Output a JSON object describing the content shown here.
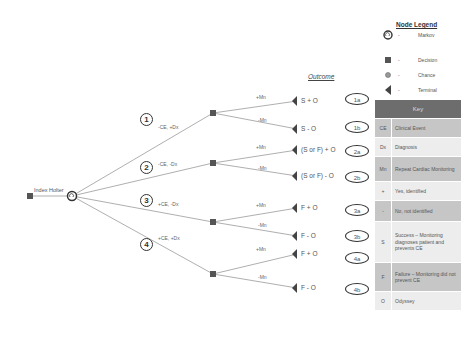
{
  "diagram": {
    "root": {
      "label": "Index Holter"
    },
    "outcome_header": "Outcome",
    "branches": [
      {
        "number": "1",
        "label": "-CE, +Dx",
        "children": [
          {
            "edge": "+Mn",
            "outcome": "S + O",
            "id": "1a"
          },
          {
            "edge": "-Mn",
            "outcome": "S - O",
            "id": "1b"
          }
        ]
      },
      {
        "number": "2",
        "label": "-CE, -Dx",
        "children": [
          {
            "edge": "+Mn",
            "outcome": "(S or F) + O",
            "id": "2a"
          },
          {
            "edge": "-Mn",
            "outcome": "(S or F) - O",
            "id": "2b"
          }
        ]
      },
      {
        "number": "3",
        "label": "+CE, -Dx",
        "children": [
          {
            "edge": "+Mn",
            "outcome": "F + O",
            "id": "3a"
          },
          {
            "edge": "-Mn",
            "outcome": "F - O",
            "id": "3b"
          }
        ]
      },
      {
        "number": "4",
        "label": "+CE, +Dx",
        "children": [
          {
            "edge": "+Mn",
            "outcome": "F + O",
            "id": "4a"
          },
          {
            "edge": "-Mn",
            "outcome": "F - O",
            "id": "4b"
          }
        ]
      }
    ]
  },
  "legend": {
    "title": "Node Legend",
    "items": [
      {
        "icon": "markov-icon",
        "dash": "-",
        "name": "Markov"
      },
      {
        "icon": "decision-icon",
        "dash": "-",
        "name": "Decision"
      },
      {
        "icon": "chance-icon",
        "dash": "-",
        "name": "Chance"
      },
      {
        "icon": "terminal-icon",
        "dash": "-",
        "name": "Terminal"
      }
    ]
  },
  "key": {
    "title": "Key",
    "rows": [
      {
        "abbr": "CE",
        "definition": "Clinical Event"
      },
      {
        "abbr": "Dx",
        "definition": "Diagnosis"
      },
      {
        "abbr": "Mn",
        "definition": "Repeat Cardiac Monitoring"
      },
      {
        "abbr": "+",
        "definition": "Yes, identified"
      },
      {
        "abbr": "-",
        "definition": "No, not identified"
      },
      {
        "abbr": "S",
        "definition": "Success – Monitoring diagnoses patient and prevents CE"
      },
      {
        "abbr": "F",
        "definition": "Failure – Monitoring did not prevent CE"
      },
      {
        "abbr": "O",
        "definition": "Odyssey"
      }
    ]
  },
  "colors": {
    "line": "#999999",
    "node": "#555555",
    "key_header": "#6d6d6d",
    "key_dark": "#c6c6c6",
    "key_light": "#ededed"
  }
}
